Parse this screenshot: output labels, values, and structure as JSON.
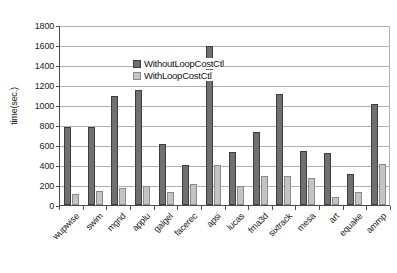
{
  "chart_data": {
    "type": "bar",
    "title": "",
    "xlabel": "",
    "ylabel": "time(sec.)",
    "ylim": [
      0,
      1800
    ],
    "ytick_step": 200,
    "yticks": [
      "1800",
      "1600",
      "1400",
      "1200",
      "1000",
      "800",
      "600",
      "400",
      "200",
      "0"
    ],
    "grid": true,
    "legend_position": "top-left inside plot",
    "categories": [
      "wupwise",
      "swim",
      "mgrid",
      "applu",
      "galgel",
      "facerec",
      "apsi",
      "lucas",
      "fma3d",
      "sixtrack",
      "mesa",
      "art",
      "equake",
      "ammp"
    ],
    "series": [
      {
        "name": "WithoutLoopCostCtl",
        "color": "#707070",
        "values": [
          780,
          780,
          1090,
          1150,
          610,
          400,
          1590,
          530,
          730,
          1110,
          540,
          520,
          310,
          1010
        ]
      },
      {
        "name": "WithLoopCostCtl",
        "color": "#c4c4c4",
        "values": [
          110,
          140,
          170,
          190,
          130,
          210,
          400,
          190,
          290,
          290,
          270,
          80,
          130,
          410
        ]
      }
    ]
  },
  "legend": {
    "items": [
      {
        "label": "WithoutLoopCostCtl",
        "swatch": "series-0-swatch"
      },
      {
        "label": "WithLoopCostCtl",
        "swatch": "series-1-swatch"
      }
    ]
  }
}
